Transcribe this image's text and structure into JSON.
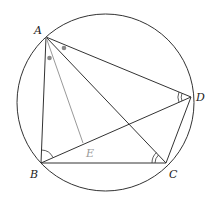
{
  "figure": {
    "type": "geometry-diagram",
    "points": [
      {
        "name": "A",
        "label": "A"
      },
      {
        "name": "B",
        "label": "B"
      },
      {
        "name": "C",
        "label": "C"
      },
      {
        "name": "D",
        "label": "D"
      },
      {
        "name": "E",
        "label": "E"
      }
    ],
    "segments": [
      "AB",
      "BC",
      "CD",
      "DA",
      "AC",
      "BD",
      "AE"
    ],
    "angle_marks": [
      {
        "vertex": "A",
        "between": [
          "AB",
          "AE"
        ],
        "style": "dot"
      },
      {
        "vertex": "A",
        "between": [
          "AC",
          "AD"
        ],
        "style": "dot"
      },
      {
        "vertex": "B",
        "between": [
          "BA",
          "BD"
        ],
        "style": "single-arc"
      },
      {
        "vertex": "C",
        "between": [
          "CB",
          "CA"
        ],
        "style": "double-arc"
      },
      {
        "vertex": "D",
        "between": [
          "DA",
          "DB"
        ],
        "style": "double-arc"
      }
    ],
    "colors": {
      "stroke": "#333333",
      "aux_stroke": "#999999",
      "dot": "#888888"
    }
  }
}
